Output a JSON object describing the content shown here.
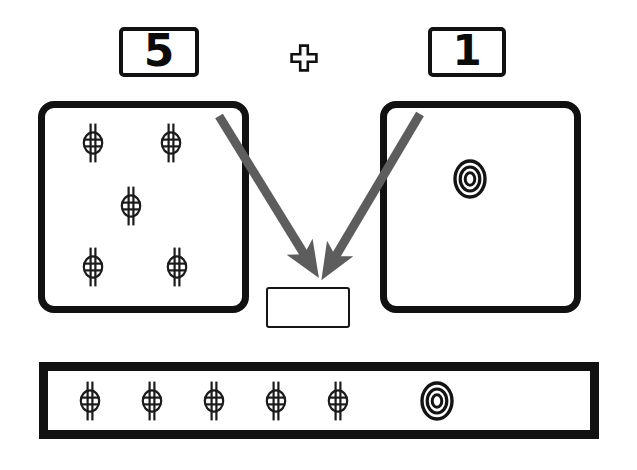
{
  "problem": {
    "type": "addition",
    "operator_symbol": "+",
    "left_addend": "5",
    "right_addend": "1",
    "sum_label": "",
    "sum_filled": false
  },
  "equation_row": {
    "left_card": {
      "value": "5",
      "name": "five"
    },
    "operator": {
      "glyph": "+",
      "name": "plus-sign"
    },
    "right_card": {
      "value": "1",
      "name": "one"
    }
  },
  "group_left": {
    "label": "left group of five",
    "count": 5,
    "token_type": "phi-token",
    "tokens": [
      {
        "x": 93,
        "y": 143,
        "type": "phi-token"
      },
      {
        "x": 171,
        "y": 143,
        "type": "phi-token"
      },
      {
        "x": 131,
        "y": 206,
        "type": "phi-token"
      },
      {
        "x": 93,
        "y": 267,
        "type": "phi-token"
      },
      {
        "x": 177,
        "y": 267,
        "type": "phi-token"
      }
    ]
  },
  "group_right": {
    "label": "right group of one",
    "count": 1,
    "token_type": "bullseye-token",
    "tokens": [
      {
        "x": 470,
        "y": 179,
        "type": "bullseye-token"
      }
    ]
  },
  "answer_box": {
    "value": "",
    "placeholder": "",
    "label": "answer box"
  },
  "arrows": [
    {
      "name": "arrow-from-left-group",
      "x1": 219,
      "y1": 116,
      "x2": 309,
      "y2": 262
    },
    {
      "name": "arrow-from-right-group",
      "x1": 420,
      "y1": 114,
      "x2": 331,
      "y2": 264
    }
  ],
  "bottom_tray": {
    "label": "combined collection tray",
    "total_count": 6,
    "tokens": [
      {
        "x": 90,
        "y": 401,
        "type": "phi-token"
      },
      {
        "x": 152,
        "y": 401,
        "type": "phi-token"
      },
      {
        "x": 214,
        "y": 401,
        "type": "phi-token"
      },
      {
        "x": 276,
        "y": 401,
        "type": "phi-token"
      },
      {
        "x": 338,
        "y": 401,
        "type": "phi-token"
      },
      {
        "x": 437,
        "y": 401,
        "type": "bullseye-token"
      }
    ]
  },
  "colors": {
    "ink": "#111111",
    "arrow_gray": "#5d5d5d",
    "paper": "#ffffff",
    "thin_rule": "#151515"
  }
}
